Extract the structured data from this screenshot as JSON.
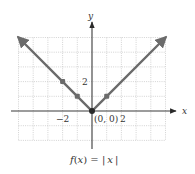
{
  "chart_data": {
    "type": "line",
    "title": "f(x) = |x|",
    "xlabel": "x",
    "ylabel": "y",
    "xlim": [
      -5,
      5
    ],
    "ylim": [
      -2,
      5
    ],
    "grid": true,
    "grid_style": "dotted",
    "legend": null,
    "series": [
      {
        "name": "f(x) = |x|",
        "x": [
          -5,
          -2,
          -1,
          0,
          1,
          5
        ],
        "y": [
          5,
          2,
          1,
          0,
          1,
          5
        ],
        "color": "#6b6b6b",
        "arrows_at_ends": true
      }
    ],
    "marked_points": [
      {
        "x": -2,
        "y": 2
      },
      {
        "x": -1,
        "y": 1
      },
      {
        "x": 0,
        "y": 0,
        "label": "(0, 0)"
      },
      {
        "x": 1,
        "y": 1
      }
    ],
    "tick_labels": {
      "x": [
        {
          "value": -2,
          "label": "−2"
        },
        {
          "value": 2,
          "label": "2"
        }
      ],
      "y": [
        {
          "value": 2,
          "label": "2"
        }
      ]
    },
    "annotations": [
      {
        "text": "(0, 0)",
        "at": [
          0,
          0
        ]
      }
    ]
  },
  "labels": {
    "x_axis": "x",
    "y_axis": "y",
    "x_tick_neg2": "−2",
    "x_tick_2": "2",
    "y_tick_2": "2",
    "origin": "(0, 0)",
    "formula_f": "f",
    "formula_open": "(",
    "formula_x1": "x",
    "formula_close_eq": ") = ",
    "formula_abs_open": "|",
    "formula_x2": "x",
    "formula_abs_close": "|"
  },
  "colors": {
    "function_line": "#6b6b6b",
    "axis": "#3a3a3a",
    "grid": "#c8c8c8",
    "text": "#333333"
  }
}
